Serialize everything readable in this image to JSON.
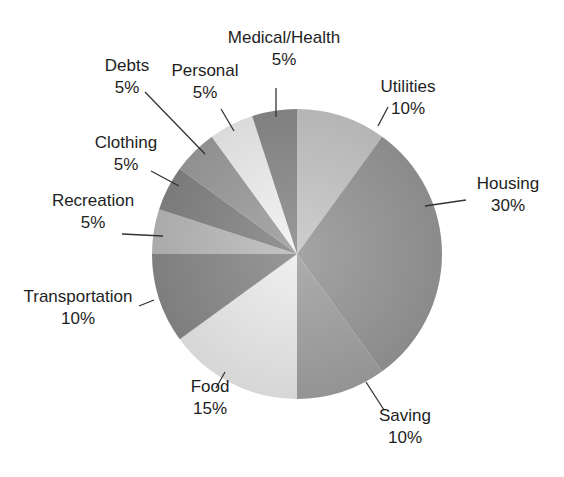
{
  "chart_data": {
    "type": "pie",
    "title": "",
    "title_note": "cropped at top edge, illegible",
    "start_angle_deg": 0,
    "direction": "clockwise",
    "center": [
      297,
      254
    ],
    "radius": 145,
    "slices": [
      {
        "label": "Utilities",
        "pct_text": "10%",
        "value": 10,
        "color": "#c9c9c9",
        "label_xy": [
          408,
          103
        ],
        "leader": [
          [
            378,
            126
          ],
          [
            388,
            107
          ]
        ]
      },
      {
        "label": "Housing",
        "pct_text": "30%",
        "value": 30,
        "color": "#9a9a9a",
        "label_xy": [
          508,
          200
        ],
        "leader": [
          [
            425,
            206
          ],
          [
            466,
            200
          ]
        ]
      },
      {
        "label": "Saving",
        "pct_text": "10%",
        "value": 10,
        "color": "#a4a4a4",
        "label_xy": [
          405,
          432
        ],
        "leader": [
          [
            366,
            382
          ],
          [
            384,
            410
          ]
        ]
      },
      {
        "label": "Food",
        "pct_text": "15%",
        "value": 15,
        "color": "#eeeeee",
        "label_xy": [
          210,
          403
        ],
        "leader": [
          [
            225,
            372
          ],
          [
            216,
            388
          ]
        ]
      },
      {
        "label": "Transportation",
        "pct_text": "10%",
        "value": 10,
        "color": "#8c8c8c",
        "label_xy": [
          78,
          313
        ],
        "leader": [
          [
            154,
            300
          ],
          [
            139,
            306
          ]
        ]
      },
      {
        "label": "Recreation",
        "pct_text": "5%",
        "value": 5,
        "color": "#bdbdbd",
        "label_xy": [
          93,
          217
        ],
        "leader": [
          [
            163,
            236
          ],
          [
            122,
            234
          ]
        ]
      },
      {
        "label": "Clothing",
        "pct_text": "5%",
        "value": 5,
        "color": "#888888",
        "label_xy": [
          126,
          159
        ],
        "leader": [
          [
            179,
            186
          ],
          [
            151,
            171
          ]
        ]
      },
      {
        "label": "Debts",
        "pct_text": "5%",
        "value": 5,
        "color": "#a0a0a0",
        "label_xy": [
          127,
          82
        ],
        "leader": [
          [
            205,
            154
          ],
          [
            145,
            92
          ]
        ]
      },
      {
        "label": "Personal",
        "pct_text": "5%",
        "value": 5,
        "color": "#f3f3f3",
        "label_xy": [
          205,
          87
        ],
        "leader": [
          [
            234,
            131
          ],
          [
            221,
            109
          ]
        ]
      },
      {
        "label": "Medical/Health",
        "pct_text": "5%",
        "value": 5,
        "color": "#8e8e8e",
        "label_xy": [
          284,
          54
        ],
        "leader": [
          [
            276,
            117
          ],
          [
            276,
            88
          ]
        ]
      }
    ],
    "legend": "none (direct labels with leader lines)"
  }
}
